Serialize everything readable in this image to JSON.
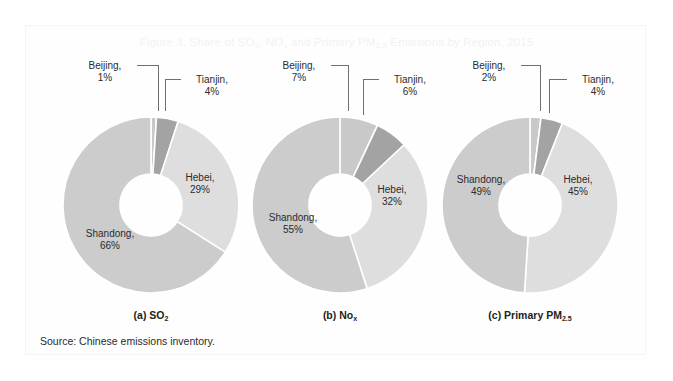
{
  "figure": {
    "title_prefix": "Figure 3. Share of SO",
    "title_full": "Figure 3. Share of SO2, NOx and Primary PM2.5 Emissions by Region, 2015",
    "title_seg1": "Figure 3. Share of SO",
    "title_sub1": "2",
    "title_seg2": ", NO",
    "title_sub2": "x",
    "title_seg3": " and Primary PM",
    "title_sub3": "2.5",
    "title_seg4": " Emissions by Region, 2015",
    "source": "Source: Chinese emissions inventory."
  },
  "colors": {
    "beijing": "#c9c9c9",
    "tianjin": "#a3a3a3",
    "hebei": "#dedede",
    "shandong": "#cccccc",
    "separator": "#ffffff",
    "label_text": "#2b2b2b",
    "leader_line": "#6f6f6f",
    "title_text": "#f2f2f2",
    "frame": "#f4f4f4"
  },
  "chart_data": [
    {
      "type": "pie",
      "id": "a",
      "title": "(a) SO2",
      "caption_main": "(a) SO",
      "caption_sub": "2",
      "categories": [
        "Beijing",
        "Tianjin",
        "Hebei",
        "Shandong"
      ],
      "values": [
        1,
        4,
        29,
        66
      ],
      "unit": "%",
      "labels": [
        {
          "name": "Beijing",
          "value": "1%",
          "text_line1": "Beijing,",
          "text_line2": "1%"
        },
        {
          "name": "Tianjin",
          "value": "4%",
          "text_line1": "Tianjin,",
          "text_line2": "4%"
        },
        {
          "name": "Hebei",
          "value": "29%",
          "text_line1": "Hebei,",
          "text_line2": "29%"
        },
        {
          "name": "Shandong",
          "value": "66%",
          "text_line1": "Shandong,",
          "text_line2": "66%"
        }
      ]
    },
    {
      "type": "pie",
      "id": "b",
      "title": "(b) NoX",
      "caption_main": "(b) No",
      "caption_sub": "x",
      "categories": [
        "Beijing",
        "Tianjin",
        "Hebei",
        "Shandong"
      ],
      "values": [
        7,
        6,
        32,
        55
      ],
      "unit": "%",
      "labels": [
        {
          "name": "Beijing",
          "value": "7%",
          "text_line1": "Beijing,",
          "text_line2": "7%"
        },
        {
          "name": "Tianjin",
          "value": "6%",
          "text_line1": "Tianjin,",
          "text_line2": "6%"
        },
        {
          "name": "Hebei",
          "value": "32%",
          "text_line1": "Hebei,",
          "text_line2": "32%"
        },
        {
          "name": "Shandong",
          "value": "55%",
          "text_line1": "Shandong,",
          "text_line2": "55%"
        }
      ]
    },
    {
      "type": "pie",
      "id": "c",
      "title": "(c) Primary PM2.5",
      "caption_main": "(c) Primary PM",
      "caption_sub": "2.5",
      "categories": [
        "Beijing",
        "Tianjin",
        "Hebei",
        "Shandong"
      ],
      "values": [
        2,
        4,
        45,
        49
      ],
      "unit": "%",
      "labels": [
        {
          "name": "Beijing",
          "value": "2%",
          "text_line1": "Beijing,",
          "text_line2": "2%"
        },
        {
          "name": "Tianjin",
          "value": "4%",
          "text_line1": "Tianjin,",
          "text_line2": "4%"
        },
        {
          "name": "Hebei",
          "value": "45%",
          "text_line1": "Hebei,",
          "text_line2": "45%"
        },
        {
          "name": "Shandong",
          "value": "49%",
          "text_line1": "Shandong,",
          "text_line2": "49%"
        }
      ]
    }
  ]
}
